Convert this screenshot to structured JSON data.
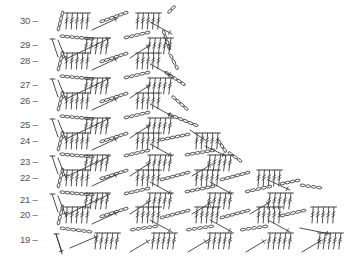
{
  "diagram": {
    "type": "crochet-stitch-chart",
    "ink_color": "#3a3a3a",
    "label_color": "#555555",
    "background": "#ffffff",
    "rows": [
      {
        "label": "30 –",
        "y": 21,
        "kind": "fan",
        "edge_x": 58,
        "tr_groups": [
          66,
          137
        ],
        "chain_arcs": [
          [
            100,
            22,
            128,
            12
          ],
          [
            168,
            13,
            175,
            6
          ]
        ],
        "sc_lines": [
          [
            92,
            30,
            118,
            18
          ],
          [
            150,
            22,
            172,
            34
          ]
        ],
        "right_end": 175
      },
      {
        "label": "29 –",
        "y": 45,
        "kind": "mesh",
        "edge_x": 52,
        "tr_groups": [
          85,
          148
        ],
        "chain_arcs": [
          [
            60,
            36,
            94,
            39
          ],
          [
            124,
            38,
            150,
            32
          ],
          [
            163,
            30,
            170,
            50
          ]
        ],
        "sc_lines": [
          [
            58,
            40,
            66,
            60
          ],
          [
            68,
            58,
            110,
            38
          ],
          [
            130,
            58,
            150,
            45
          ]
        ],
        "right_end": 170
      },
      {
        "label": "28 –",
        "y": 61,
        "kind": "fan",
        "edge_x": 58,
        "tr_groups": [
          66,
          137
        ],
        "chain_arcs": [
          [
            100,
            62,
            128,
            53
          ],
          [
            170,
            54,
            178,
            70
          ]
        ],
        "sc_lines": [
          [
            92,
            70,
            118,
            58
          ],
          [
            150,
            64,
            172,
            76
          ]
        ],
        "right_end": 178
      },
      {
        "label": "27 –",
        "y": 85,
        "kind": "mesh",
        "edge_x": 52,
        "tr_groups": [
          85,
          148
        ],
        "chain_arcs": [
          [
            60,
            76,
            94,
            79
          ],
          [
            124,
            78,
            150,
            72
          ],
          [
            165,
            72,
            185,
            85
          ]
        ],
        "sc_lines": [
          [
            58,
            80,
            66,
            100
          ],
          [
            68,
            98,
            110,
            78
          ],
          [
            130,
            98,
            150,
            85
          ]
        ],
        "right_end": 185
      },
      {
        "label": "26 –",
        "y": 101,
        "kind": "fan",
        "edge_x": 58,
        "tr_groups": [
          66,
          137
        ],
        "chain_arcs": [
          [
            100,
            102,
            128,
            93
          ],
          [
            172,
            96,
            188,
            110
          ]
        ],
        "sc_lines": [
          [
            92,
            110,
            118,
            98
          ],
          [
            150,
            104,
            172,
            116
          ]
        ],
        "right_end": 190
      },
      {
        "label": "25 –",
        "y": 125,
        "kind": "mesh",
        "edge_x": 52,
        "tr_groups": [
          85,
          148
        ],
        "chain_arcs": [
          [
            60,
            116,
            94,
            119
          ],
          [
            124,
            118,
            150,
            112
          ],
          [
            168,
            114,
            198,
            126
          ]
        ],
        "sc_lines": [
          [
            58,
            120,
            66,
            140
          ],
          [
            68,
            138,
            110,
            118
          ],
          [
            130,
            138,
            150,
            125
          ],
          [
            190,
            130,
            205,
            140
          ]
        ],
        "right_end": 205
      },
      {
        "label": "24 –",
        "y": 141,
        "kind": "fan",
        "edge_x": 58,
        "tr_groups": [
          66,
          137,
          196
        ],
        "chain_arcs": [
          [
            100,
            142,
            128,
            133
          ],
          [
            160,
            140,
            190,
            134
          ],
          [
            218,
            140,
            226,
            152
          ]
        ],
        "sc_lines": [
          [
            92,
            150,
            118,
            138
          ],
          [
            150,
            144,
            172,
            156
          ],
          [
            205,
            146,
            226,
            156
          ]
        ],
        "right_end": 228
      },
      {
        "label": "23 –",
        "y": 162,
        "kind": "mesh",
        "edge_x": 52,
        "tr_groups": [
          85,
          148,
          208
        ],
        "chain_arcs": [
          [
            60,
            154,
            94,
            157
          ],
          [
            124,
            156,
            150,
            150
          ],
          [
            185,
            155,
            215,
            150
          ],
          [
            228,
            152,
            242,
            162
          ]
        ],
        "sc_lines": [
          [
            58,
            158,
            66,
            178
          ],
          [
            68,
            176,
            110,
            156
          ],
          [
            130,
            176,
            150,
            163
          ],
          [
            192,
            176,
            212,
            164
          ]
        ],
        "right_end": 242
      },
      {
        "label": "22 –",
        "y": 178,
        "kind": "fan",
        "edge_x": 58,
        "tr_groups": [
          66,
          137,
          196,
          258
        ],
        "chain_arcs": [
          [
            100,
            179,
            128,
            170
          ],
          [
            160,
            180,
            190,
            172
          ],
          [
            220,
            180,
            250,
            172
          ],
          [
            280,
            184,
            300,
            180
          ]
        ],
        "sc_lines": [
          [
            92,
            186,
            118,
            174
          ],
          [
            150,
            182,
            172,
            194
          ],
          [
            210,
            182,
            232,
            194
          ],
          [
            268,
            180,
            290,
            190
          ]
        ],
        "right_end": 300
      },
      {
        "label": "21 –",
        "y": 200,
        "kind": "mesh",
        "edge_x": 52,
        "tr_groups": [
          85,
          148,
          208,
          268
        ],
        "chain_arcs": [
          [
            60,
            192,
            94,
            195
          ],
          [
            124,
            194,
            150,
            188
          ],
          [
            185,
            192,
            215,
            186
          ],
          [
            245,
            192,
            272,
            186
          ],
          [
            300,
            185,
            322,
            188
          ]
        ],
        "sc_lines": [
          [
            58,
            196,
            66,
            216
          ],
          [
            68,
            214,
            110,
            194
          ],
          [
            130,
            214,
            150,
            201
          ],
          [
            192,
            214,
            212,
            202
          ],
          [
            250,
            214,
            270,
            202
          ]
        ],
        "right_end": 322
      },
      {
        "label": "20 –",
        "y": 215,
        "kind": "fan",
        "edge_x": 58,
        "tr_groups": [
          66,
          137,
          196,
          258,
          312
        ],
        "chain_arcs": [
          [
            100,
            217,
            128,
            208
          ],
          [
            160,
            218,
            190,
            210
          ],
          [
            220,
            218,
            250,
            210
          ],
          [
            280,
            216,
            306,
            210
          ]
        ],
        "sc_lines": [
          [
            92,
            224,
            118,
            212
          ],
          [
            150,
            220,
            172,
            232
          ],
          [
            210,
            220,
            232,
            232
          ],
          [
            268,
            220,
            290,
            232
          ],
          [
            300,
            228,
            330,
            234
          ]
        ],
        "right_end": 335
      },
      {
        "label": "19 –",
        "y": 240,
        "kind": "mesh",
        "edge_x": 56,
        "tr_groups": [
          95,
          152,
          208,
          268,
          318
        ],
        "chain_arcs": [
          [
            60,
            228,
            92,
            232
          ],
          [
            130,
            230,
            158,
            226
          ],
          [
            186,
            230,
            214,
            226
          ],
          [
            240,
            230,
            268,
            226
          ]
        ],
        "sc_lines": [
          [
            56,
            234,
            62,
            254
          ],
          [
            70,
            248,
            98,
            236
          ],
          [
            130,
            252,
            150,
            240
          ],
          [
            188,
            252,
            208,
            240
          ],
          [
            246,
            252,
            266,
            240
          ],
          [
            302,
            252,
            322,
            240
          ]
        ],
        "right_end": 330
      }
    ]
  }
}
